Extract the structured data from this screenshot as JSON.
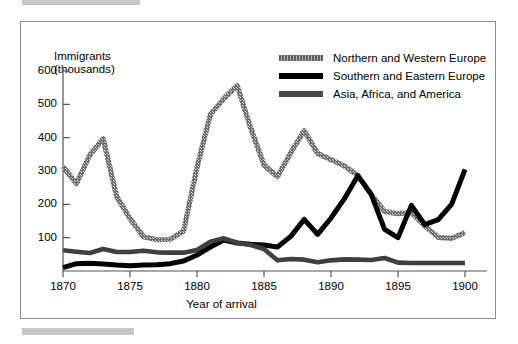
{
  "figure": {
    "frame_color": "#8d8d8d",
    "background": "#ffffff"
  },
  "legend": {
    "position": "top-right",
    "entries": [
      {
        "label": "Northern and Western Europe",
        "color": "#6e6e6e",
        "style": "dithered-gray"
      },
      {
        "label": "Southern and Eastern Europe",
        "color": "#000000",
        "style": "solid-black"
      },
      {
        "label": "Asia, Africa, and America",
        "color": "#4a4a4a",
        "style": "solid-gray"
      }
    ]
  },
  "axes": {
    "y_title_line1": "Immigrants",
    "y_title_line2": "(thousands)",
    "x_title": "Year of arrival",
    "y_ticks": [
      "600",
      "500",
      "400",
      "300",
      "200",
      "100"
    ],
    "x_ticks": [
      "1870",
      "1875",
      "1880",
      "1885",
      "1890",
      "1895",
      "1900"
    ]
  },
  "chart_data": {
    "type": "line",
    "title": "",
    "xlabel": "Year of arrival",
    "ylabel": "Immigrants (thousands)",
    "xlim": [
      1870,
      1900
    ],
    "ylim": [
      0,
      600
    ],
    "grid": false,
    "legend_position": "top-right",
    "x": [
      1870,
      1871,
      1872,
      1873,
      1874,
      1875,
      1876,
      1877,
      1878,
      1879,
      1880,
      1881,
      1882,
      1883,
      1884,
      1885,
      1886,
      1887,
      1888,
      1889,
      1890,
      1891,
      1892,
      1893,
      1894,
      1895,
      1896,
      1897,
      1898,
      1899,
      1900
    ],
    "series": [
      {
        "name": "Northern and Western Europe",
        "color": "#6e6e6e",
        "values": [
          313,
          262,
          348,
          397,
          224,
          157,
          103,
          94,
          95,
          120,
          310,
          470,
          517,
          556,
          430,
          318,
          283,
          355,
          421,
          353,
          334,
          315,
          287,
          230,
          178,
          172,
          176,
          135,
          101,
          98,
          115
        ]
      },
      {
        "name": "Southern and Eastern Europe",
        "color": "#000000",
        "values": [
          10,
          22,
          23,
          21,
          18,
          16,
          18,
          19,
          22,
          30,
          48,
          72,
          93,
          84,
          80,
          78,
          72,
          104,
          155,
          110,
          159,
          217,
          286,
          230,
          125,
          100,
          197,
          139,
          154,
          200,
          305
        ]
      },
      {
        "name": "Asia, Africa, and America",
        "color": "#4a4a4a",
        "values": [
          62,
          58,
          54,
          66,
          57,
          57,
          61,
          56,
          55,
          55,
          63,
          88,
          98,
          85,
          78,
          66,
          32,
          36,
          34,
          26,
          32,
          35,
          34,
          33,
          39,
          25,
          24,
          24,
          24,
          24,
          24
        ]
      }
    ]
  }
}
